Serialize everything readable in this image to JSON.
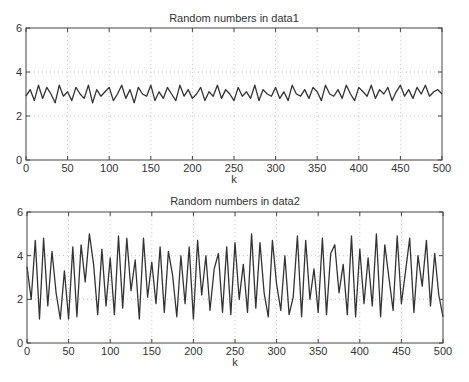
{
  "chart_data": [
    {
      "type": "line",
      "title": "Random numbers in data1",
      "xlabel": "k",
      "ylabel": "",
      "xlim": [
        0,
        500
      ],
      "ylim": [
        0,
        6
      ],
      "xticks": [
        0,
        50,
        100,
        150,
        200,
        250,
        300,
        350,
        400,
        450,
        500
      ],
      "yticks": [
        0,
        2,
        4,
        6
      ],
      "grid": true,
      "legend": null,
      "series": [
        {
          "name": "data1",
          "color": "#333333",
          "x_step": 5,
          "values": [
            2.9,
            3.2,
            2.7,
            3.4,
            2.8,
            3.3,
            3.0,
            2.6,
            3.4,
            2.9,
            3.1,
            2.7,
            3.3,
            3.0,
            2.8,
            3.4,
            2.6,
            3.2,
            2.9,
            3.1,
            3.3,
            2.7,
            3.0,
            3.4,
            2.8,
            3.2,
            2.6,
            3.3,
            3.0,
            2.9,
            3.4,
            2.7,
            3.1,
            2.8,
            3.3,
            3.0,
            2.7,
            3.4,
            2.9,
            3.2,
            2.8,
            3.0,
            3.3,
            2.7,
            3.1,
            2.9,
            3.4,
            2.8,
            3.2,
            3.0,
            2.7,
            3.3,
            2.9,
            3.1,
            2.8,
            3.4,
            2.7,
            3.2,
            3.0,
            2.9,
            3.3,
            2.8,
            3.1,
            2.7,
            3.4,
            3.0,
            2.9,
            3.2,
            2.8,
            3.3,
            3.1,
            2.7,
            3.4,
            3.0,
            2.9,
            3.2,
            2.8,
            3.4,
            3.0,
            2.7,
            3.3,
            3.1,
            2.9,
            3.4,
            2.8,
            3.2,
            3.0,
            3.3,
            2.7,
            3.1,
            3.4,
            2.9,
            3.2,
            2.8,
            3.3,
            3.0,
            3.4,
            2.9,
            3.1,
            3.2,
            3.0
          ]
        }
      ]
    },
    {
      "type": "line",
      "title": "Random numbers in data2",
      "xlabel": "k",
      "ylabel": "",
      "xlim": [
        0,
        500
      ],
      "ylim": [
        0,
        6
      ],
      "xticks": [
        0,
        50,
        100,
        150,
        200,
        250,
        300,
        350,
        400,
        450,
        500
      ],
      "yticks": [
        0,
        2,
        4,
        6
      ],
      "grid": true,
      "legend": null,
      "series": [
        {
          "name": "data2",
          "color": "#333333",
          "x_step": 5,
          "values": [
            3.5,
            2.0,
            4.7,
            1.1,
            4.8,
            1.7,
            4.2,
            2.3,
            1.1,
            3.3,
            1.1,
            4.4,
            1.2,
            4.5,
            2.8,
            5.0,
            3.6,
            1.3,
            4.3,
            1.7,
            3.9,
            1.3,
            4.9,
            1.6,
            4.8,
            2.4,
            3.8,
            1.1,
            4.8,
            2.1,
            3.7,
            1.8,
            4.4,
            1.4,
            4.2,
            3.1,
            1.2,
            4.0,
            1.8,
            4.4,
            1.1,
            4.7,
            2.2,
            4.0,
            1.5,
            3.4,
            4.1,
            1.4,
            4.4,
            1.3,
            4.6,
            2.0,
            3.6,
            1.4,
            5.0,
            1.6,
            4.6,
            2.3,
            1.2,
            4.7,
            2.7,
            1.5,
            4.0,
            1.3,
            2.1,
            4.9,
            1.2,
            4.7,
            2.0,
            3.4,
            1.4,
            4.8,
            1.3,
            4.1,
            4.5,
            2.3,
            3.6,
            1.3,
            4.9,
            1.2,
            4.3,
            1.8,
            3.9,
            1.7,
            5.0,
            1.2,
            4.5,
            3.0,
            1.5,
            4.9,
            1.8,
            3.3,
            4.8,
            1.4,
            4.0,
            2.6,
            4.7,
            1.7,
            4.1,
            2.2,
            1.2
          ]
        }
      ]
    }
  ]
}
